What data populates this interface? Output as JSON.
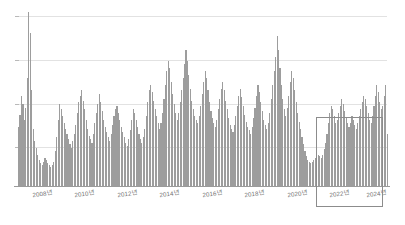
{
  "chart_data": {
    "type": "bar",
    "title": "",
    "subtitle": "",
    "xlabel": "",
    "ylabel": "",
    "grid": true,
    "legend": false,
    "legend_position": "none",
    "bar_color": "#9d9d9d",
    "gridline_color": "#e2e2e2",
    "axis_color": "#9a9a9a",
    "highlight_color": "#8c8c8c",
    "x_tick_labels": [
      "2008년",
      "2010년",
      "2012년",
      "2014년",
      "2016년",
      "2018년",
      "2020년",
      "2022년",
      "2024년"
    ],
    "x_tick_positions_pct": [
      6.5,
      18.0,
      29.5,
      41.0,
      52.5,
      64.0,
      75.5,
      87.0,
      97.0
    ],
    "ylim": [
      0,
      100
    ],
    "gridline_values": [
      100,
      75,
      50,
      25
    ],
    "y_axis_labels_visible": false,
    "annotations": [
      {
        "type": "rectangle",
        "name": "recent-period-highlight",
        "covers": "2022년 ~ 2024년",
        "x_start_pct": 80.8,
        "x_end_pct": 99.0
      }
    ],
    "x_start": "2008-01",
    "x_end": "2024-12",
    "x_interval": "monthly",
    "n_points": 204,
    "values": [
      34,
      41,
      52,
      47,
      38,
      45,
      62,
      100,
      88,
      55,
      33,
      26,
      22,
      18,
      15,
      13,
      12,
      14,
      16,
      15,
      13,
      12,
      11,
      12,
      14,
      20,
      28,
      38,
      47,
      44,
      40,
      36,
      33,
      30,
      27,
      24,
      22,
      26,
      30,
      35,
      42,
      48,
      52,
      55,
      49,
      44,
      38,
      33,
      29,
      27,
      25,
      30,
      36,
      42,
      47,
      53,
      48,
      43,
      38,
      34,
      31,
      28,
      26,
      30,
      35,
      40,
      44,
      46,
      42,
      38,
      34,
      31,
      28,
      25,
      23,
      27,
      32,
      38,
      44,
      42,
      38,
      34,
      30,
      27,
      25,
      28,
      33,
      40,
      48,
      55,
      58,
      54,
      49,
      44,
      40,
      36,
      33,
      36,
      42,
      50,
      58,
      66,
      72,
      68,
      60,
      53,
      47,
      42,
      38,
      42,
      48,
      55,
      62,
      70,
      78,
      72,
      64,
      56,
      49,
      44,
      40,
      38,
      36,
      40,
      46,
      53,
      60,
      66,
      62,
      55,
      48,
      43,
      39,
      36,
      34,
      38,
      44,
      50,
      56,
      60,
      55,
      49,
      44,
      39,
      35,
      33,
      31,
      35,
      40,
      46,
      52,
      56,
      51,
      46,
      41,
      37,
      34,
      32,
      30,
      34,
      39,
      45,
      52,
      58,
      54,
      48,
      43,
      38,
      35,
      33,
      36,
      42,
      50,
      58,
      66,
      74,
      86,
      78,
      68,
      58,
      50,
      44,
      40,
      45,
      52,
      60,
      66,
      62,
      55,
      48,
      42,
      37,
      33,
      28,
      24,
      20,
      17,
      15,
      14,
      13,
      14,
      15,
      16,
      17,
      18,
      17,
      16,
      18,
      21,
      25,
      30,
      36,
      42,
      46,
      44,
      40,
      36,
      38,
      42,
      46,
      50,
      47,
      43,
      39,
      36,
      34,
      36,
      40,
      38,
      35,
      33,
      36,
      40,
      44,
      48,
      52,
      50,
      46,
      42,
      38,
      36,
      40,
      46,
      52,
      58,
      54,
      48,
      44,
      46,
      52,
      58,
      30
    ]
  }
}
